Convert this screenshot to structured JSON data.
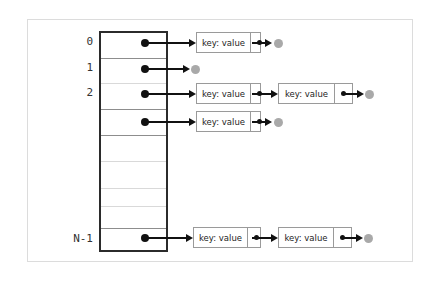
{
  "diagram": {
    "node_label": "key: value",
    "colors": {
      "frame": "#dcdcdc",
      "array_border": "#2b2b2b",
      "row_divider": "#8d8d8d",
      "row_divider_light": "#d9d9d9",
      "pointer_dot": "#111111",
      "null_dot": "#a9a9a9",
      "node_border": "#9a9a9a",
      "text": "#1d1d1d",
      "background": "#ffffff"
    },
    "buckets": [
      {
        "index_label": "0",
        "has_pointer": true,
        "chain_length": 1,
        "terminates_null": true,
        "nodes": [
          {
            "text": "key: value"
          }
        ]
      },
      {
        "index_label": "1",
        "has_pointer": true,
        "chain_length": 0,
        "terminates_null": true,
        "nodes": []
      },
      {
        "index_label": "2",
        "has_pointer": true,
        "chain_length": 2,
        "terminates_null": true,
        "nodes": [
          {
            "text": "key: value"
          },
          {
            "text": "key: value"
          }
        ]
      },
      {
        "index_label": "",
        "has_pointer": true,
        "chain_length": 1,
        "terminates_null": true,
        "nodes": [
          {
            "text": "key: value"
          }
        ]
      },
      {
        "index_label": "",
        "has_pointer": false,
        "chain_length": 0,
        "terminates_null": false,
        "nodes": []
      },
      {
        "index_label": "",
        "has_pointer": false,
        "chain_length": 0,
        "terminates_null": false,
        "nodes": []
      },
      {
        "index_label": "",
        "has_pointer": false,
        "chain_length": 0,
        "terminates_null": false,
        "nodes": []
      },
      {
        "index_label": "",
        "has_pointer": false,
        "chain_length": 0,
        "terminates_null": false,
        "nodes": []
      },
      {
        "index_label": "N-1",
        "has_pointer": true,
        "chain_length": 2,
        "terminates_null": true,
        "nodes": [
          {
            "text": "key: value"
          },
          {
            "text": "key: value"
          }
        ]
      }
    ]
  }
}
